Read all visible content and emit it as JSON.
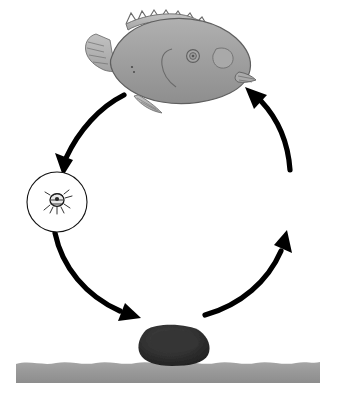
{
  "figure": {
    "title": "Fish parasite life cycle diagram",
    "background_color": "#ffffff",
    "width": 348,
    "height": 400,
    "caption": ""
  },
  "palette": {
    "fish_body": "#9b9b9b",
    "fish_body_light": "#adadad",
    "fish_outline": "#5c5c5c",
    "seabed": "#9a9a9a",
    "seabed_dark": "#8a8a8a",
    "arrow": "#000000",
    "circle_stroke": "#111111",
    "circle_fill": "#ffffff",
    "rock_dark": "#2a2a2a",
    "rock_mid": "#3b3b3b",
    "organism_ink": "#1a1a1a",
    "worm_light": "#f2f2f2"
  },
  "stages": [
    {
      "id": "fish",
      "name": "host-fish",
      "label": "Host fish",
      "cx": 174,
      "cy": 62,
      "shape": "illustration"
    },
    {
      "id": "larva",
      "name": "larva-stage",
      "label": "Free-swimming larva",
      "cx": 57,
      "cy": 202,
      "r": 30,
      "shape": "circle",
      "organism_count": 1
    },
    {
      "id": "eggs",
      "name": "egg-mass-stage",
      "label": "Egg mass on substrate",
      "cx": 174,
      "cy": 322,
      "r": 29,
      "shape": "circle",
      "organism_count": 3
    },
    {
      "id": "adults",
      "name": "adult-stage",
      "label": "Adult parasites",
      "cx": 290,
      "cy": 202,
      "r": 30,
      "shape": "circle",
      "organism_count": 4
    }
  ],
  "arrows": [
    {
      "id": "fish-to-larva",
      "name": "arrow-fish-to-larva",
      "from": "fish",
      "to": "larva",
      "direction": "down-left"
    },
    {
      "id": "larva-to-eggs",
      "name": "arrow-larva-to-eggs",
      "from": "larva",
      "to": "eggs",
      "direction": "down-right"
    },
    {
      "id": "eggs-to-adults",
      "name": "arrow-eggs-to-adults",
      "from": "eggs",
      "to": "adults",
      "direction": "up-right"
    },
    {
      "id": "adults-to-fish",
      "name": "arrow-adults-to-fish",
      "from": "adults",
      "to": "fish",
      "direction": "up-left"
    }
  ],
  "seabed": {
    "label": "Sea floor substrate",
    "top_y": 360,
    "bottom_y": 383,
    "left_x": 16,
    "right_x": 320
  }
}
